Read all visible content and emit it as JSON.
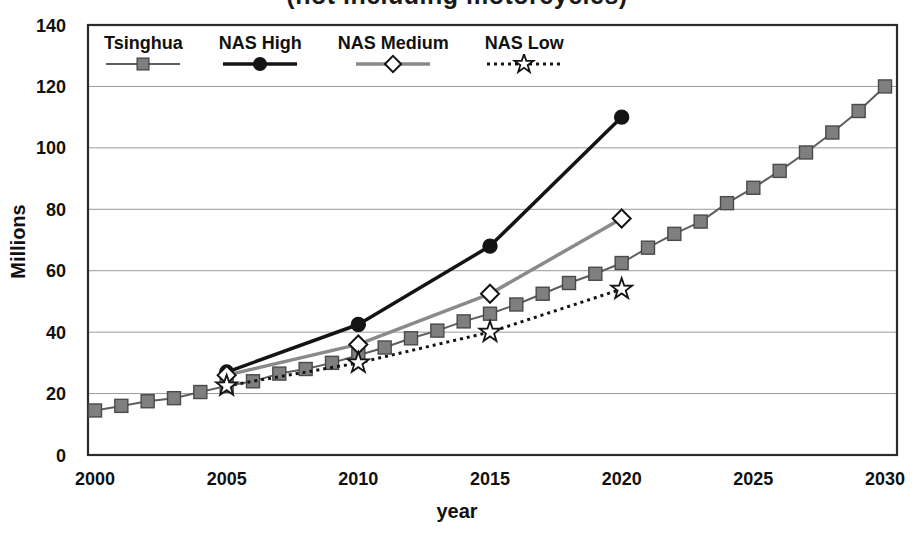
{
  "figure": {
    "clipped_title": "(not including motorcycles)",
    "background": "#ffffff"
  },
  "chart_data": {
    "type": "line",
    "title": "(not including motorcycles)",
    "title_note": "title is cut off at top edge of image; only bottoms of letters visible",
    "xlabel": "year",
    "ylabel": "Millions",
    "xlim": [
      2000,
      2030
    ],
    "ylim": [
      0,
      140
    ],
    "x_ticks": [
      2000,
      2005,
      2010,
      2015,
      2020,
      2025,
      2030
    ],
    "y_ticks": [
      0,
      20,
      40,
      60,
      80,
      100,
      120,
      140
    ],
    "grid": "horizontal",
    "legend_position": "top-left-inside",
    "colors": {
      "grid_line": "#9a9a9a",
      "plot_border": "#2b2b2b",
      "tsinghua_gray": "#7f7f7f",
      "medium_gray_line": "#8a8a8a",
      "black": "#141414",
      "white": "#ffffff"
    },
    "series": [
      {
        "name": "Tsinghua",
        "marker": "square",
        "marker_fill": "#7f7f7f",
        "marker_stroke": "#4a4a4a",
        "line_color": "#5e5e5e",
        "line_width": 2,
        "line_style": "solid",
        "x": [
          2000,
          2001,
          2002,
          2003,
          2004,
          2005,
          2006,
          2007,
          2008,
          2009,
          2010,
          2011,
          2012,
          2013,
          2014,
          2015,
          2016,
          2017,
          2018,
          2019,
          2020,
          2021,
          2022,
          2023,
          2024,
          2025,
          2026,
          2027,
          2028,
          2029,
          2030
        ],
        "values": [
          14.5,
          16,
          17.5,
          18.5,
          20.5,
          22.5,
          24,
          26.5,
          28,
          30,
          32.5,
          35,
          38,
          40.5,
          43.5,
          46,
          49,
          52.5,
          56,
          59,
          62.5,
          67.5,
          72,
          76,
          82,
          87,
          92.5,
          98.5,
          105,
          112,
          120
        ]
      },
      {
        "name": "NAS High",
        "marker": "circle",
        "marker_fill": "#141414",
        "marker_stroke": "#141414",
        "line_color": "#141414",
        "line_width": 3.5,
        "line_style": "solid",
        "x": [
          2005,
          2010,
          2015,
          2020
        ],
        "values": [
          27,
          42.5,
          68,
          110
        ]
      },
      {
        "name": "NAS Medium",
        "marker": "diamond",
        "marker_fill": "#ffffff",
        "marker_stroke": "#141414",
        "line_color": "#8a8a8a",
        "line_width": 3.5,
        "line_style": "solid",
        "x": [
          2005,
          2010,
          2015,
          2020
        ],
        "values": [
          26,
          36,
          52.5,
          77
        ]
      },
      {
        "name": "NAS Low",
        "marker": "star",
        "marker_fill": "#ffffff",
        "marker_stroke": "#141414",
        "line_color": "#141414",
        "line_width": 3,
        "line_style": "dotted",
        "x": [
          2005,
          2010,
          2015,
          2020
        ],
        "values": [
          22.5,
          30,
          40,
          54
        ]
      }
    ]
  }
}
